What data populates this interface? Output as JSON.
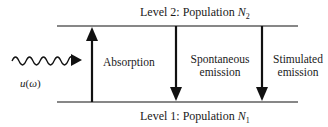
{
  "diagram": {
    "type": "energy-level-transitions",
    "levels": [
      {
        "id": "level2",
        "label_prefix": "Level 2: Population ",
        "var": "N",
        "sub": "2"
      },
      {
        "id": "level1",
        "label_prefix": "Level 1: Population ",
        "var": "N",
        "sub": "1"
      }
    ],
    "incident_wave": {
      "label": "u(ω)",
      "label_u": "u",
      "label_paren_open": "(",
      "label_omega": "ω",
      "label_paren_close": ")"
    },
    "transitions": [
      {
        "name": "absorption",
        "direction": "up",
        "label_line1": "Absorption",
        "label_line2": ""
      },
      {
        "name": "spontaneous-emission",
        "direction": "down",
        "label_line1": "Spontaneous",
        "label_line2": "emission"
      },
      {
        "name": "stimulated-emission",
        "direction": "down",
        "label_line1": "Stimulated",
        "label_line2": "emission"
      }
    ],
    "colors": {
      "line": "#111111",
      "background": "#ffffff"
    }
  }
}
